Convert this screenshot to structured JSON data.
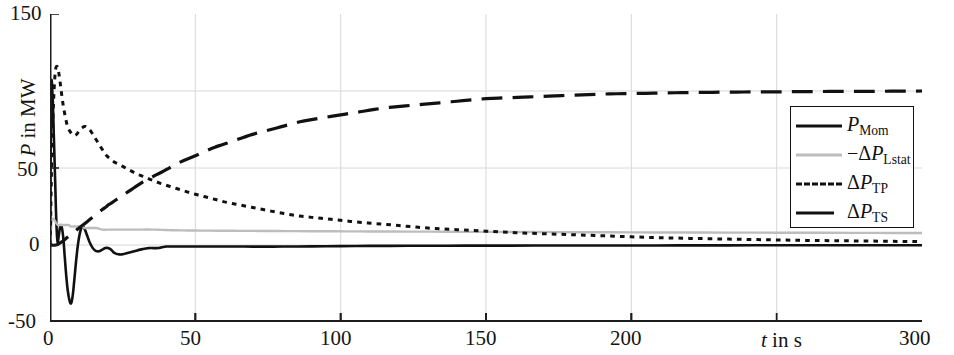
{
  "chart_data": {
    "type": "line",
    "title": "",
    "xlabel": "t in s",
    "ylabel": "P in MW",
    "xlim": [
      0,
      300
    ],
    "ylim": [
      -50,
      150
    ],
    "xticks": [
      0,
      50,
      100,
      150,
      200,
      300
    ],
    "xtick_labels": [
      "0",
      "50",
      "100",
      "150",
      "200",
      "300"
    ],
    "yticks": [
      -50,
      0,
      50,
      150
    ],
    "ytick_labels": [
      "-50",
      "0",
      "50",
      "150"
    ],
    "gridlines_x": [
      50,
      100,
      150,
      200,
      250
    ],
    "gridlines_y": [
      0,
      50,
      100
    ],
    "grid": true,
    "legend_position": "right-upper",
    "series": [
      {
        "name": "P_Mom",
        "label": "P",
        "label_sub": "Mom",
        "style": "solid",
        "color": "#111111",
        "width": 2.6,
        "x": [
          0,
          0.4,
          0.9,
          1.3,
          1.8,
          2.2,
          2.6,
          3.0,
          3.4,
          3.8,
          4.2,
          4.6,
          5.0,
          5.5,
          6.0,
          6.6,
          7.2,
          7.8,
          8.4,
          9.0,
          9.6,
          10.2,
          10.8,
          11.4,
          12.0,
          12.8,
          13.6,
          14.4,
          15.2,
          16.0,
          17.0,
          18.0,
          19.0,
          20.0,
          21.0,
          22.0,
          23.5,
          25.0,
          27.0,
          29.0,
          31.0,
          34.0,
          37.0,
          40.0,
          45.0,
          50.0,
          60.0,
          80.0,
          110.0,
          150.0,
          200.0,
          250.0,
          300.0
        ],
        "y": [
          0,
          100,
          96,
          72,
          40,
          14,
          2,
          6,
          11,
          13,
          10,
          4,
          -6,
          -18,
          -28,
          -35,
          -38,
          -33,
          -22,
          -10,
          0,
          7,
          11,
          12,
          10,
          6,
          2,
          -1,
          -3,
          -4,
          -4,
          -3,
          -2,
          -2,
          -3,
          -5,
          -6,
          -6,
          -5,
          -4,
          -3,
          -2,
          -2,
          -1,
          -1,
          -1,
          -1,
          -1,
          -0.6,
          -0.4,
          -0.3,
          -0.2,
          -0.2
        ]
      },
      {
        "name": "-dP_Lstat",
        "label": "−ΔP",
        "label_sub": "Lstat",
        "style": "solid",
        "color": "#bdbdbd",
        "width": 2.4,
        "x": [
          0,
          0.5,
          1.0,
          1.6,
          2.2,
          2.8,
          3.4,
          4.0,
          4.8,
          5.6,
          6.4,
          7.2,
          8.0,
          9.0,
          10.0,
          11.0,
          12.0,
          13.0,
          14.5,
          16.0,
          18.0,
          20.0,
          23.0,
          26.0,
          30.0,
          35.0,
          42.0,
          50.0,
          65.0,
          85.0,
          110.0,
          150.0,
          200.0,
          250.0,
          300.0
        ],
        "y": [
          0,
          15,
          17,
          16,
          14,
          13,
          13,
          13,
          13,
          13,
          13,
          12,
          12,
          12,
          12,
          12,
          11,
          11,
          11,
          11,
          10,
          10,
          10,
          10,
          10,
          10,
          9.6,
          9.4,
          9.2,
          9.0,
          8.8,
          8.5,
          8.2,
          8.0,
          7.8
        ]
      },
      {
        "name": "dP_TP",
        "label": "ΔP",
        "label_sub": "TP",
        "style": "dotted",
        "color": "#111111",
        "width": 3.0,
        "x": [
          0,
          0.6,
          1.2,
          1.8,
          2.4,
          3.0,
          3.6,
          4.2,
          4.8,
          5.4,
          6.0,
          6.8,
          7.6,
          8.4,
          9.2,
          10.0,
          11.0,
          12.0,
          13.0,
          14.0,
          15.0,
          16.0,
          17.0,
          18.0,
          19.0,
          20.0,
          22.0,
          24.0,
          27.0,
          30.0,
          34.0,
          38.0,
          43.0,
          48.0,
          54.0,
          60.0,
          68.0,
          76.0,
          85.0,
          95.0,
          105.0,
          118.0,
          130.0,
          145.0,
          160.0,
          175.0,
          190.0,
          205.0,
          220.0,
          240.0,
          260.0,
          280.0,
          300.0
        ],
        "y": [
          0,
          55,
          92,
          112,
          116,
          112,
          104,
          95,
          88,
          82,
          77,
          74,
          72,
          71,
          72,
          74,
          76,
          77,
          76,
          74,
          71,
          68,
          65,
          62,
          59,
          57,
          54,
          52,
          49,
          46,
          43,
          40,
          37,
          34,
          31,
          28,
          25,
          22,
          19,
          17,
          15,
          13,
          11,
          9.5,
          8,
          7,
          6,
          5,
          4.3,
          3.6,
          3.0,
          2.6,
          2.2
        ]
      },
      {
        "name": "dP_TS",
        "label": "ΔP",
        "label_sub": "TS",
        "style": "dashed",
        "color": "#111111",
        "width": 3.2,
        "x": [
          0,
          2,
          4,
          6,
          8,
          10,
          12,
          14,
          16,
          18,
          20,
          24,
          28,
          32,
          36,
          40,
          45,
          50,
          56,
          62,
          70,
          78,
          86,
          95,
          105,
          115,
          126,
          138,
          150,
          163,
          176,
          190,
          205,
          220,
          236,
          252,
          268,
          284,
          300
        ],
        "y": [
          0,
          0,
          2,
          5,
          8,
          11,
          14,
          17,
          20,
          23,
          26,
          31,
          36,
          41,
          45,
          49,
          54,
          58,
          63,
          67,
          72,
          76,
          80,
          83,
          86,
          89,
          91,
          93,
          95,
          96,
          97,
          98,
          98.5,
          99,
          99.3,
          99.5,
          99.7,
          99.8,
          100
        ]
      }
    ]
  },
  "axes": {
    "y_label_text": "P in MW",
    "y_label_italic": "P",
    "y_label_rest": " in MW",
    "x_label_italic": "t",
    "x_label_rest": " in s"
  },
  "legend": {
    "items": [
      {
        "key": "solid-black-line",
        "label": "P",
        "sub": "Mom",
        "prefix": ""
      },
      {
        "key": "solid-gray-line",
        "label": "P",
        "sub": "Lstat",
        "prefix": "−Δ"
      },
      {
        "key": "dotted-black-line",
        "label": "P",
        "sub": "TP",
        "prefix": "Δ"
      },
      {
        "key": "dashed-black-line",
        "label": "P",
        "sub": "TS",
        "prefix": "Δ"
      }
    ]
  }
}
